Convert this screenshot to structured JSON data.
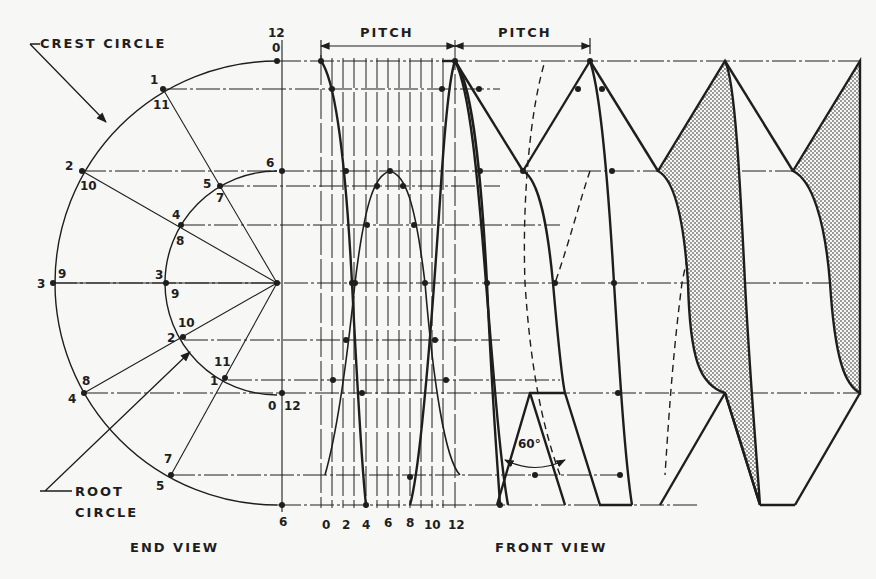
{
  "figure": {
    "callouts": {
      "crest_circle": "CREST CIRCLE",
      "root_circle_line1": "ROOT",
      "root_circle_line2": "CIRCLE"
    },
    "view_captions": {
      "end_view": "END VIEW",
      "front_view": "FRONT VIEW"
    },
    "dimensions": {
      "pitch_1": "PITCH",
      "pitch_2": "PITCH",
      "thread_angle": "60°"
    },
    "crest_circle_points": [
      {
        "outer": "12",
        "inner": "0"
      },
      {
        "outer": "1",
        "inner": "11"
      },
      {
        "outer": "2",
        "inner": "10"
      },
      {
        "outer": "3",
        "inner": "9"
      },
      {
        "outer": "4",
        "inner": "8"
      },
      {
        "outer": "5",
        "inner": "7"
      },
      {
        "outer": "6",
        "inner": ""
      }
    ],
    "root_circle_points": [
      {
        "outer": "6",
        "inner": ""
      },
      {
        "outer": "5",
        "inner": "7"
      },
      {
        "outer": "4",
        "inner": "8"
      },
      {
        "outer": "3",
        "inner": "9"
      },
      {
        "outer": "2",
        "inner": "10"
      },
      {
        "outer": "1",
        "inner": "11"
      },
      {
        "outer": "0",
        "inner": "12"
      }
    ],
    "pitch_division_labels": [
      "0",
      "2",
      "4",
      "6",
      "8",
      "10",
      "12"
    ],
    "background_text_lines": [
      "",
      "",
      "",
      "",
      "",
      "",
      "",
      "",
      "",
      "",
      "",
      "",
      "",
      "",
      "",
      "",
      "",
      "",
      "",
      "",
      "",
      ""
    ],
    "colors": {
      "ink": "#1e1e1e",
      "paper": "#f7f7f5",
      "shading": "#9a9a9a"
    }
  }
}
